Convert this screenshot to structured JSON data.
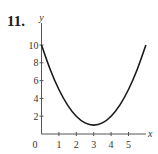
{
  "problem_number": "11.",
  "chart_data": {
    "type": "line",
    "title": "",
    "xlabel": "x",
    "ylabel": "y",
    "xlim": [
      0,
      6
    ],
    "ylim": [
      0,
      10
    ],
    "x_ticks": [
      1,
      2,
      3,
      4,
      5
    ],
    "x_tick_labels": [
      "1",
      "2",
      "3",
      "4",
      "5"
    ],
    "y_ticks": [
      2,
      4,
      6,
      8,
      10
    ],
    "y_tick_labels": [
      "2",
      "4",
      "6",
      "8",
      "10"
    ],
    "origin_label": "0",
    "grid": false,
    "legend": null,
    "series": [
      {
        "name": "f(x) = (x-3)^2 + 1",
        "x": [
          0,
          0.5,
          1,
          1.5,
          2,
          2.5,
          3,
          3.5,
          4,
          4.5,
          5,
          5.5,
          6
        ],
        "y": [
          10,
          7.25,
          5,
          3.25,
          2,
          1.25,
          1,
          1.25,
          2,
          3.25,
          5,
          7.25,
          10
        ]
      }
    ]
  },
  "colors": {
    "axis": "#555555",
    "curve": "#1a1a1a",
    "text": "#333333"
  }
}
